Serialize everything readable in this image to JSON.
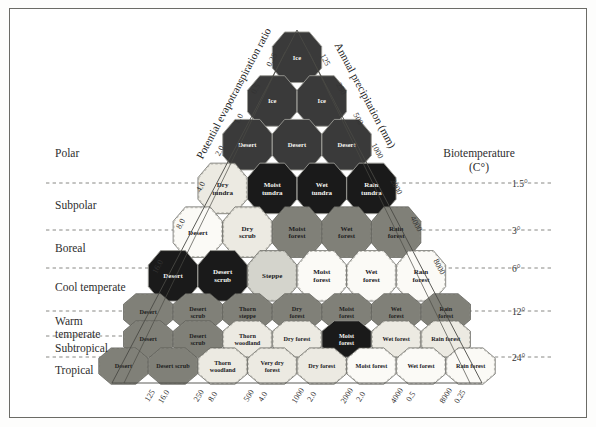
{
  "figure": {
    "type": "holdridge-life-zone-triangle",
    "axis_left_title": "Potential evapotranspiration ratio",
    "axis_right_title": "Annual precipitation (mm)",
    "axis_temp_title_line1": "Biotemperature",
    "axis_temp_title_line2": "(C°)"
  },
  "axes": {
    "pet_ratio_left": [
      "0.25",
      "0.5",
      "1.0",
      "2.0",
      "4.0",
      "8.0",
      "16.0"
    ],
    "precipitation_right": [
      "125",
      "250",
      "500",
      "1000",
      "2000",
      "4000",
      "8000"
    ],
    "biotemperature": [
      "1.5°",
      "3°",
      "6°",
      "12°",
      "24°"
    ],
    "bottom_precipitation": [
      "125",
      "250",
      "500",
      "1000",
      "2000",
      "4000",
      "8000"
    ],
    "bottom_pet_ratio": [
      "16.0",
      "8.0",
      "4.0",
      "2.0",
      "2.0",
      "0.5",
      "0.25"
    ]
  },
  "latitudinal_regions": [
    {
      "label": "Polar"
    },
    {
      "label": "Subpolar"
    },
    {
      "label": "Boreal"
    },
    {
      "label": "Cool temperate"
    },
    {
      "label": "Warm"
    },
    {
      "label": "temperate"
    },
    {
      "label": "Subtropical"
    },
    {
      "label": "Tropical"
    }
  ],
  "colors": {
    "very_dark": "#1a1a1a",
    "dark_gray": "#3a3a3a",
    "mid_gray": "#808078",
    "light_gray": "#d4d4cc",
    "pale": "#eceae2",
    "white": "#fbfaf6",
    "outline": "#5a5a55",
    "dashed": "#6a6a66"
  },
  "chart_data": {
    "type": "diagram",
    "rows": [
      {
        "region": "Polar",
        "cells": [
          {
            "label": "Ice",
            "tone": "dark_gray"
          }
        ]
      },
      {
        "region": "Polar",
        "cells": [
          {
            "label": "Ice",
            "tone": "dark_gray"
          },
          {
            "label": "Ice",
            "tone": "dark_gray"
          }
        ]
      },
      {
        "region": "Polar",
        "cells": [
          {
            "label": "Desert",
            "tone": "dark_gray"
          },
          {
            "label": "Desert",
            "tone": "dark_gray"
          },
          {
            "label": "Desert",
            "tone": "dark_gray"
          }
        ]
      },
      {
        "region": "Subpolar",
        "cells": [
          {
            "label": "Dry tundra",
            "tone": "pale"
          },
          {
            "label": "Moist tundra",
            "tone": "very_dark"
          },
          {
            "label": "Wet tundra",
            "tone": "very_dark"
          },
          {
            "label": "Rain tundra",
            "tone": "very_dark"
          }
        ]
      },
      {
        "region": "Boreal",
        "cells": [
          {
            "label": "Desert",
            "tone": "white"
          },
          {
            "label": "Dry scrub",
            "tone": "pale"
          },
          {
            "label": "Moist forest",
            "tone": "mid_gray"
          },
          {
            "label": "Wet forest",
            "tone": "mid_gray"
          },
          {
            "label": "Rain forest",
            "tone": "mid_gray"
          }
        ]
      },
      {
        "region": "Cool temperate",
        "cells": [
          {
            "label": "Desert",
            "tone": "very_dark"
          },
          {
            "label": "Desert scrub",
            "tone": "very_dark"
          },
          {
            "label": "Steppe",
            "tone": "light_gray"
          },
          {
            "label": "Moist forest",
            "tone": "white"
          },
          {
            "label": "Wet forest",
            "tone": "white"
          },
          {
            "label": "Rain forest",
            "tone": "white"
          }
        ]
      },
      {
        "region": "Warm temperate",
        "cells": [
          {
            "label": "Desert",
            "tone": "mid_gray"
          },
          {
            "label": "Desert scrub",
            "tone": "mid_gray"
          },
          {
            "label": "Thorn steppe",
            "tone": "mid_gray"
          },
          {
            "label": "Dry forest",
            "tone": "mid_gray"
          },
          {
            "label": "Moist forest",
            "tone": "mid_gray"
          },
          {
            "label": "Wet forest",
            "tone": "mid_gray"
          },
          {
            "label": "Rain forest",
            "tone": "mid_gray"
          }
        ]
      },
      {
        "region": "Subtropical",
        "cells": [
          {
            "label": "Desert",
            "tone": "mid_gray"
          },
          {
            "label": "Desert scrub",
            "tone": "mid_gray"
          },
          {
            "label": "Thorn woodland",
            "tone": "pale"
          },
          {
            "label": "Dry forest",
            "tone": "pale"
          },
          {
            "label": "Moist forest",
            "tone": "very_dark"
          },
          {
            "label": "Wet forest",
            "tone": "pale"
          },
          {
            "label": "Rain forest",
            "tone": "pale"
          }
        ]
      },
      {
        "region": "Tropical",
        "cells": [
          {
            "label": "Desert",
            "tone": "mid_gray"
          },
          {
            "label": "Desert scrub",
            "tone": "mid_gray"
          },
          {
            "label": "Thorn woodland",
            "tone": "pale"
          },
          {
            "label": "Very dry forest",
            "tone": "pale"
          },
          {
            "label": "Dry forest",
            "tone": "pale"
          },
          {
            "label": "Moist forest",
            "tone": "white"
          },
          {
            "label": "Wet forest",
            "tone": "white"
          },
          {
            "label": "Rain forest",
            "tone": "white"
          }
        ]
      }
    ]
  }
}
